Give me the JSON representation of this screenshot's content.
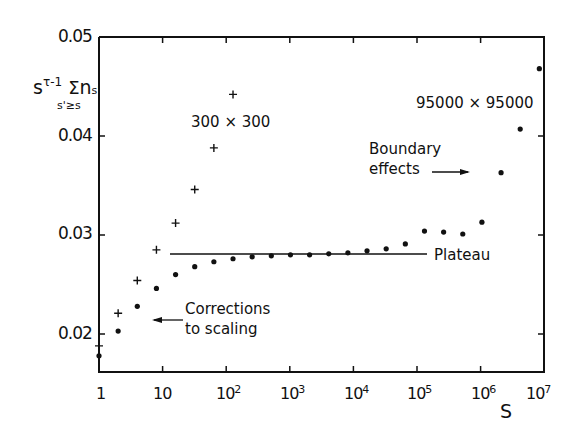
{
  "chart_data": {
    "type": "scatter",
    "title": "",
    "xlabel": "S",
    "ylabel": "s^(τ-1) Σ_(s'≥s) n_s'",
    "xscale": "log",
    "xlim": [
      1,
      10000000
    ],
    "ylim": [
      0.016,
      0.05
    ],
    "grid": false,
    "x_tick_labels": [
      "1",
      "10",
      "10^2",
      "10^3",
      "10^4",
      "10^5",
      "10^6",
      "10^7"
    ],
    "y_tick_labels": [
      "0.02",
      "0.03",
      "0.04",
      "0.05"
    ],
    "series": [
      {
        "name": "300 × 300",
        "marker": "plus",
        "x": [
          1,
          2,
          4,
          8,
          16,
          32,
          64,
          128
        ],
        "y": [
          0.0188,
          0.0221,
          0.0254,
          0.0285,
          0.0312,
          0.0346,
          0.0388,
          0.0442
        ]
      },
      {
        "name": "95000 × 95000",
        "marker": "dot",
        "x": [
          1,
          2,
          4,
          8,
          16,
          32,
          64,
          128,
          256,
          512,
          1024,
          2048,
          4096,
          8192,
          16384,
          32768,
          65536,
          131072,
          262144,
          524288,
          1048576,
          2097152,
          4194304,
          8388608
        ],
        "y": [
          0.0178,
          0.0203,
          0.0228,
          0.0246,
          0.026,
          0.0268,
          0.0273,
          0.0276,
          0.0278,
          0.0279,
          0.028,
          0.028,
          0.0281,
          0.0282,
          0.0284,
          0.0286,
          0.0291,
          0.0304,
          0.0303,
          0.0301,
          0.0313,
          0.0363,
          0.0407,
          0.0468
        ]
      }
    ],
    "reference_lines": [
      {
        "name": "Plateau",
        "y": 0.0281,
        "x_range": [
          14,
          70000
        ]
      }
    ],
    "annotations": [
      {
        "text": "300 × 300",
        "near": "plus series upper"
      },
      {
        "text": "95000 × 95000",
        "near": "dot series upper right"
      },
      {
        "text": "Boundary effects",
        "arrow": "right"
      },
      {
        "text": "Plateau"
      },
      {
        "text": "Corrections to scaling",
        "arrow": "left"
      }
    ]
  },
  "labels": {
    "y_axis": {
      "base": "s",
      "exp": "τ-1",
      "sigma": "Σ",
      "sub": "s'≥s",
      "n": "n",
      "nsub": "s'"
    },
    "x_axis": "S",
    "y_ticks": [
      "0.05",
      "0.04",
      "0.03",
      "0.02"
    ],
    "x_ticks": [
      {
        "base": "1",
        "exp": ""
      },
      {
        "base": "10",
        "exp": ""
      },
      {
        "base": "10",
        "exp": "2"
      },
      {
        "base": "10",
        "exp": "3"
      },
      {
        "base": "10",
        "exp": "4"
      },
      {
        "base": "10",
        "exp": "5"
      },
      {
        "base": "10",
        "exp": "6"
      },
      {
        "base": "10",
        "exp": "7"
      }
    ],
    "series_small": "300 × 300",
    "series_large": "95000 × 95000",
    "boundary_1": "Boundary",
    "boundary_2": "effects",
    "plateau": "Plateau",
    "corrections_1": "Corrections",
    "corrections_2": "to scaling"
  }
}
